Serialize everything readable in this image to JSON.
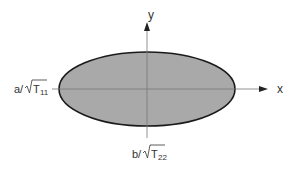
{
  "diagram": {
    "axes": {
      "x_label": "x",
      "y_label": "y"
    },
    "labels": {
      "a_prefix": "a/",
      "a_sub_base": "T",
      "a_subscript": "11",
      "b_prefix": "b/",
      "b_sub_base": "T",
      "b_subscript": "22"
    },
    "colors": {
      "fill": "#a9a9a9",
      "stroke": "#1a1a1a",
      "axis": "#777777",
      "text": "#333333"
    },
    "ellipse": {
      "cx": 147,
      "cy": 89,
      "rx": 88,
      "ry": 37
    }
  }
}
